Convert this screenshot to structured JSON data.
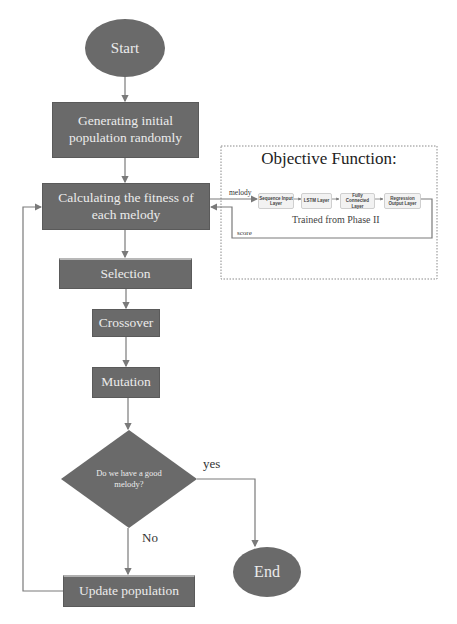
{
  "flowchart": {
    "start": {
      "label": "Start"
    },
    "generate": {
      "label": "Generating initial population randomly"
    },
    "fitness": {
      "label": "Calculating the fitness of each melody"
    },
    "selection": {
      "label": "Selection"
    },
    "crossover": {
      "label": "Crossover"
    },
    "mutation": {
      "label": "Mutation"
    },
    "decision": {
      "label": "Do we have a good melody?"
    },
    "yes_label": "yes",
    "no_label": "No",
    "update": {
      "label": "Update population"
    },
    "end": {
      "label": "End"
    }
  },
  "objective_function": {
    "title": "Objective Function:",
    "input_label": "melody",
    "output_label": "score",
    "subtitle": "Trained from Phase II",
    "layers": [
      {
        "label": "Sequence Input Layer"
      },
      {
        "label": "LSTM Layer"
      },
      {
        "label": "Fully Connected Layer"
      },
      {
        "label": "Regression Output Layer"
      }
    ]
  },
  "colors": {
    "node_fill": "#6a6a6a",
    "node_text": "#ececec",
    "connector": "#7a7a7a",
    "layer_fill": "#f2f2f2"
  }
}
